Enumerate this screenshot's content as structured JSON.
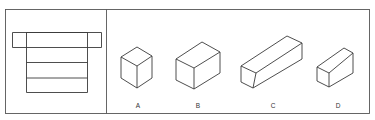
{
  "figure": {
    "question_panel": {
      "description": "Orthographic view (top view with extended flange) of an object"
    },
    "options": [
      {
        "label": "A",
        "shape": "cube"
      },
      {
        "label": "B",
        "shape": "rectangular-box"
      },
      {
        "label": "C",
        "shape": "long-rectangular-bar"
      },
      {
        "label": "D",
        "shape": "wedge-block"
      }
    ]
  }
}
